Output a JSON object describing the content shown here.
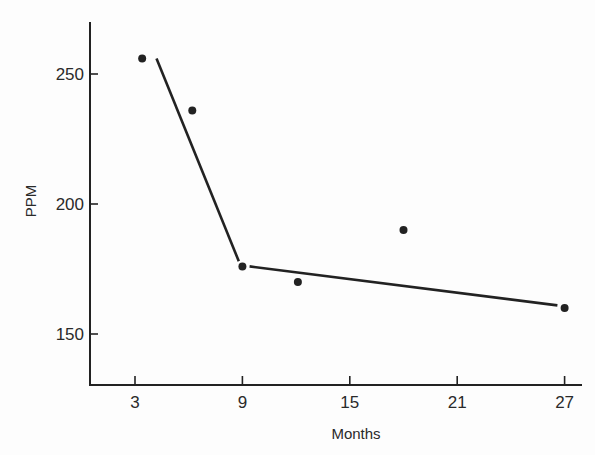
{
  "chart_data": {
    "type": "scatter",
    "title": "",
    "xlabel": "Months",
    "ylabel": "PPM",
    "xlim": [
      0.4,
      28.5
    ],
    "ylim": [
      130,
      268
    ],
    "xticks": [
      3,
      9,
      15,
      21,
      27
    ],
    "yticks": [
      150,
      200,
      250
    ],
    "grid": false,
    "legend": null,
    "series": [
      {
        "name": "observed",
        "kind": "scatter",
        "points": [
          {
            "x": 3.4,
            "y": 256
          },
          {
            "x": 6.2,
            "y": 236
          },
          {
            "x": 9.0,
            "y": 176
          },
          {
            "x": 12.1,
            "y": 170
          },
          {
            "x": 18.0,
            "y": 190
          },
          {
            "x": 27.0,
            "y": 160
          }
        ]
      },
      {
        "name": "fit-segment-1",
        "kind": "line",
        "points": [
          {
            "x": 4.2,
            "y": 256
          },
          {
            "x": 8.8,
            "y": 178
          }
        ]
      },
      {
        "name": "fit-segment-2",
        "kind": "line",
        "points": [
          {
            "x": 9.4,
            "y": 176
          },
          {
            "x": 26.6,
            "y": 161
          }
        ]
      }
    ]
  },
  "colors": {
    "ink": "#222222",
    "background": "#fdfdfd"
  }
}
